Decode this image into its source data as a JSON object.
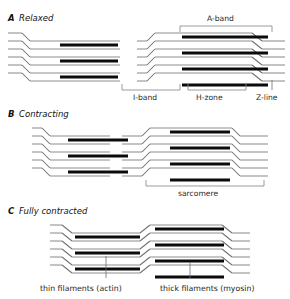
{
  "figure": {
    "title_cropped": "",
    "background_color": "#ffffff",
    "thin_filament_color": "#8e8e8e",
    "thick_filament_color": "#0b0b0b",
    "bracket_color": "#8a8a8a",
    "text_color": "#1a1a1a"
  },
  "panels": [
    {
      "letter": "A",
      "name": "Relaxed",
      "annotations": [
        {
          "id": "a-band",
          "label": "A-band",
          "position": "top"
        },
        {
          "id": "i-band",
          "label": "I-band",
          "position": "bottom"
        },
        {
          "id": "h-zone",
          "label": "H-zone",
          "position": "bottom"
        },
        {
          "id": "z-line",
          "label": "Z-line",
          "position": "bottom-right"
        }
      ]
    },
    {
      "letter": "B",
      "name": "Contracting",
      "annotations": [
        {
          "id": "sarcomere",
          "label": "sarcomere",
          "position": "bottom"
        }
      ]
    },
    {
      "letter": "C",
      "name": "Fully contracted",
      "annotations": []
    }
  ],
  "legend": {
    "thin": "thin filaments (actin)",
    "thick": "thick filaments (myosin)"
  }
}
